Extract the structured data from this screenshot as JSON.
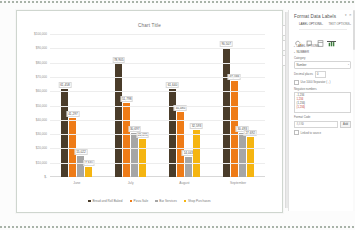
{
  "chart_data": {
    "type": "bar",
    "title": "Chart Title",
    "xlabel": "",
    "ylabel": "",
    "categories": [
      "June",
      "July",
      "August",
      "September"
    ],
    "ylim": [
      0,
      100000
    ],
    "ytick_labels": [
      "$100,000",
      "$90,000",
      "$80,000",
      "$70,000",
      "$60,000",
      "$50,000",
      "$40,000",
      "$30,000",
      "$20,000",
      "$10,000",
      "$-"
    ],
    "ytick_values": [
      100000,
      90000,
      80000,
      70000,
      60000,
      50000,
      40000,
      30000,
      20000,
      10000,
      0
    ],
    "grid": true,
    "legend_position": "bottom",
    "series": [
      {
        "name": "Bread and Roll Baked",
        "color": "#4a3c2a",
        "values": [
          61458,
          78905,
          61640,
          90507
        ],
        "labels": [
          "61,458",
          "78,905",
          "61,640",
          "90,507"
        ]
      },
      {
        "name": "Pizza Sale",
        "color": "#ee7b17",
        "values": [
          41297,
          51798,
          45485,
          67099
        ],
        "labels": [
          "41,297",
          "51,798",
          "45,485",
          "67,099"
        ]
      },
      {
        "name": "Bar Services",
        "color": "#a6a6a6",
        "values": [
          15022,
          30697,
          14043,
          30493
        ],
        "labels": [
          "15,022",
          "30,697",
          "14,043",
          "30,493"
        ]
      },
      {
        "name": "Shop Purchases",
        "color": "#f5b511",
        "values": [
          7340,
          26695,
          32593,
          27692
        ],
        "labels": [
          "7,340",
          "26,695",
          "32,593",
          "27,692"
        ]
      }
    ]
  },
  "chart_buttons": [
    {
      "name": "chart-elements",
      "glyph": "+"
    },
    {
      "name": "chart-styles",
      "glyph": "brush"
    },
    {
      "name": "chart-filters",
      "glyph": "funnel"
    }
  ],
  "pane": {
    "title": "Format Data Labels",
    "close_glyph": "✕",
    "back_glyph": "▾",
    "tabs": [
      {
        "label": "LABEL OPTIONS",
        "active": true,
        "caret": "▾"
      },
      {
        "label": "TEXT OPTIONS",
        "active": false,
        "caret": "▾"
      }
    ],
    "icons": [
      {
        "name": "fill-line-icon",
        "selected": false
      },
      {
        "name": "effects-icon",
        "selected": false
      },
      {
        "name": "size-properties-icon",
        "selected": false
      },
      {
        "name": "label-options-icon",
        "selected": true
      }
    ],
    "sections": [
      {
        "label": "LABEL OPTIONS",
        "tri": "▸"
      },
      {
        "label": "NUMBER",
        "tri": "▾"
      }
    ],
    "category": {
      "label": "Category",
      "value": "Number",
      "caret": "▾"
    },
    "decimal_places": {
      "label": "Decimal places",
      "value": "0"
    },
    "separator": {
      "label": "Use 1000 Separator ( , )",
      "checked": false
    },
    "negative_numbers": {
      "label": "Negative numbers",
      "options": [
        {
          "text": "-1,234",
          "red": false
        },
        {
          "text": "1,234",
          "red": true
        },
        {
          "text": "(1,234)",
          "red": false
        },
        {
          "text": "(1,234)",
          "red": true
        }
      ]
    },
    "format_code": {
      "label": "Format Code",
      "value": "#,##0",
      "button": "Add"
    },
    "linked_to_source": {
      "label": "Linked to source",
      "checked": false
    }
  }
}
